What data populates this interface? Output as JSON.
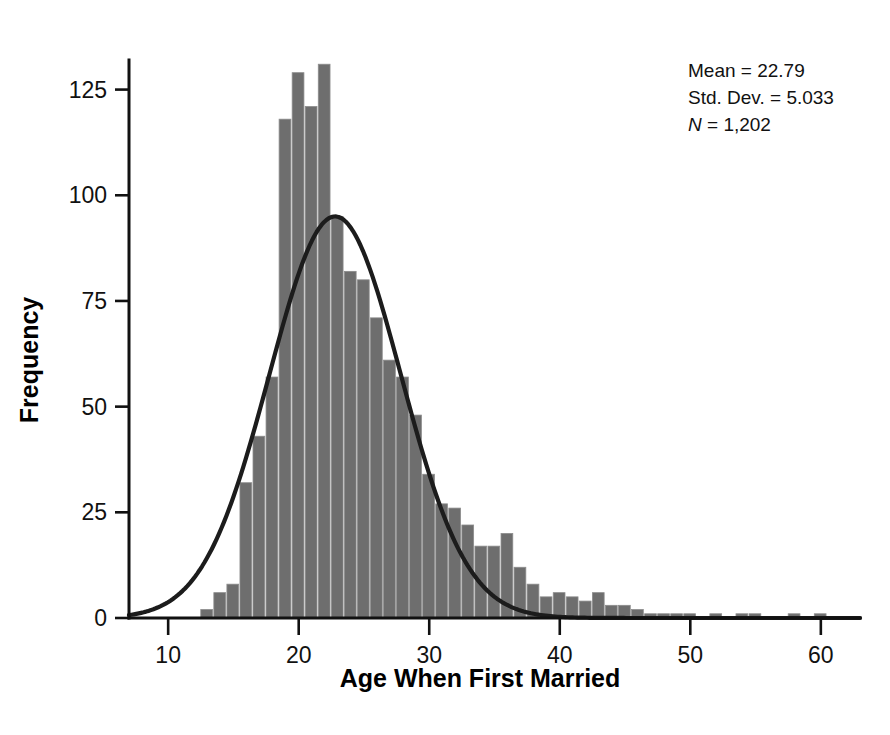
{
  "chart_data": {
    "type": "bar",
    "title": "",
    "subtitle": "",
    "xlabel": "Age When First Married",
    "ylabel": "Frequency",
    "xlim": [
      7,
      63
    ],
    "ylim": [
      0,
      132
    ],
    "grid": false,
    "legend": null,
    "bin_width": 1,
    "x_ticks": [
      10,
      20,
      30,
      40,
      50,
      60
    ],
    "y_ticks": [
      0,
      25,
      50,
      75,
      100,
      125
    ],
    "x": [
      13,
      14,
      15,
      16,
      17,
      18,
      19,
      20,
      21,
      22,
      23,
      24,
      25,
      26,
      27,
      28,
      29,
      30,
      31,
      32,
      33,
      34,
      35,
      36,
      37,
      38,
      39,
      40,
      41,
      42,
      43,
      44,
      45,
      46,
      47,
      48,
      49,
      50,
      51,
      52,
      53,
      54,
      55,
      56,
      57,
      58,
      59,
      60,
      61,
      62
    ],
    "categories": [
      "13",
      "14",
      "15",
      "16",
      "17",
      "18",
      "19",
      "20",
      "21",
      "22",
      "23",
      "24",
      "25",
      "26",
      "27",
      "28",
      "29",
      "30",
      "31",
      "32",
      "33",
      "34",
      "35",
      "36",
      "37",
      "38",
      "39",
      "40",
      "41",
      "42",
      "43",
      "44",
      "45",
      "46",
      "47",
      "48",
      "49",
      "50",
      "51",
      "52",
      "53",
      "54",
      "55",
      "56",
      "57",
      "58",
      "59",
      "60",
      "61",
      "62"
    ],
    "values": [
      2,
      6,
      8,
      32,
      43,
      57,
      118,
      129,
      121,
      131,
      95,
      82,
      80,
      71,
      61,
      57,
      48,
      34,
      27,
      26,
      22,
      17,
      17,
      20,
      12,
      8,
      5,
      6,
      5,
      4,
      6,
      3,
      3,
      2,
      1,
      1,
      1,
      1,
      0,
      1,
      0,
      1,
      1,
      0,
      0,
      1,
      0,
      1,
      0,
      0
    ],
    "overlay_curve": {
      "name": "Normal distribution curve",
      "mean": 22.79,
      "std_dev": 5.033,
      "n": 1202,
      "peak_value": 95,
      "color": "#1c1c1c"
    },
    "bar_color": "#6e6e6e"
  },
  "annotations": {
    "stats_box": {
      "mean_label": "Mean = 22.79",
      "std_dev_label": "Std. Dev. = 5.033",
      "n_symbol": "N",
      "n_equals": " = 1,202"
    }
  },
  "axes": {
    "x": {
      "title": "Age When First Married",
      "tick_labels": [
        "10",
        "20",
        "30",
        "40",
        "50",
        "60"
      ]
    },
    "y": {
      "title": "Frequency",
      "tick_labels": [
        "0",
        "25",
        "50",
        "75",
        "100",
        "125"
      ]
    }
  }
}
